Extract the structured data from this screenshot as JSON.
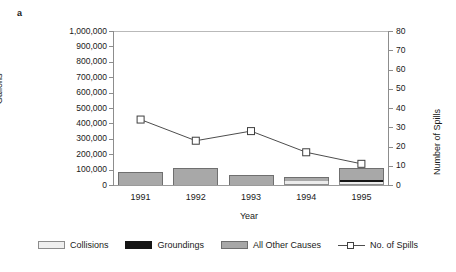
{
  "panel": {
    "letter": "a"
  },
  "chart_data": {
    "type": "bar",
    "title": "",
    "subtitle": "",
    "xlabel": "Year",
    "ylabel": "Gallons",
    "y2label": "Number of Spills",
    "categories": [
      "1991",
      "1992",
      "1993",
      "1994",
      "1995"
    ],
    "ylim": [
      0,
      1000000
    ],
    "y2lim": [
      0,
      80
    ],
    "yticks": [
      "0",
      "100,000",
      "200,000",
      "300,000",
      "400,000",
      "500,000",
      "600,000",
      "700,000",
      "800,000",
      "900,000",
      "1,000,000"
    ],
    "ytick_values": [
      0,
      100000,
      200000,
      300000,
      400000,
      500000,
      600000,
      700000,
      800000,
      900000,
      1000000
    ],
    "y2ticks": [
      "0",
      "10",
      "20",
      "30",
      "40",
      "50",
      "60",
      "70",
      "80"
    ],
    "y2tick_values": [
      0,
      10,
      20,
      30,
      40,
      50,
      60,
      70,
      80
    ],
    "grid": false,
    "legend_position": "bottom",
    "stacked": true,
    "series": [
      {
        "name": "Collisions",
        "axis": "left",
        "color": "#efefef",
        "values": [
          0,
          0,
          0,
          28000,
          20000
        ]
      },
      {
        "name": "Groundings",
        "axis": "left",
        "color": "#151515",
        "values": [
          0,
          0,
          0,
          0,
          14000
        ]
      },
      {
        "name": "All Other Causes",
        "axis": "left",
        "color": "#a8a8a8",
        "values": [
          85000,
          112000,
          62000,
          22000,
          78000
        ]
      },
      {
        "name": "No. of Spills",
        "axis": "right",
        "color": "#4d4d4d",
        "type": "line",
        "marker": "square",
        "values": [
          34,
          23,
          28,
          17,
          11
        ]
      }
    ]
  },
  "legend": {
    "items": [
      {
        "label": "Collisions",
        "icon": "square-swatch-light"
      },
      {
        "label": "Groundings",
        "icon": "square-swatch-black"
      },
      {
        "label": "All Other Causes",
        "icon": "square-swatch-gray"
      },
      {
        "label": "No. of Spills",
        "icon": "line-marker-square"
      }
    ]
  }
}
